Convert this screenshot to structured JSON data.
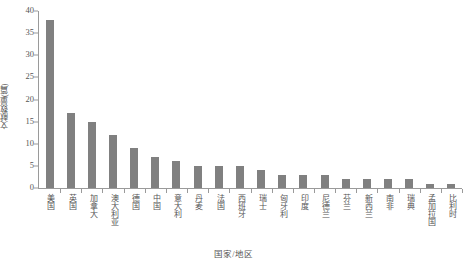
{
  "chart_data": {
    "type": "bar",
    "title": "",
    "xlabel": "国家/地区",
    "ylabel": "文献数量(篇)",
    "ylim": [
      0,
      40
    ],
    "yticks": [
      0,
      5,
      10,
      15,
      20,
      25,
      30,
      35,
      40
    ],
    "grid": false,
    "legend": null,
    "bar_color": "#808080",
    "axis_color": "#9a9a9a",
    "text_color": "#555555",
    "categories": [
      "美国",
      "英国",
      "加拿大",
      "澳大利亚",
      "德国",
      "中国",
      "意大利",
      "丹麦",
      "法国",
      "西班牙",
      "瑞士",
      "匈牙利",
      "印度",
      "尼德兰",
      "芬兰",
      "新西兰",
      "南非",
      "瑞典",
      "孟加拉国",
      "比利时"
    ],
    "values": [
      38,
      17,
      15,
      12,
      9,
      7,
      6,
      5,
      5,
      5,
      4,
      3,
      3,
      3,
      2,
      2,
      2,
      2,
      1,
      1
    ]
  }
}
